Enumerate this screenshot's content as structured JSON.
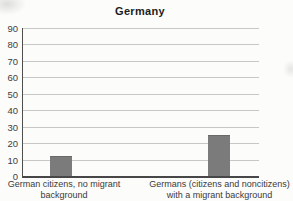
{
  "chart_data": {
    "type": "bar",
    "title": "Germany",
    "categories": [
      "German citizens, no migrant background",
      "Germans (citizens and noncitizens) with a migrant background"
    ],
    "values": [
      12,
      25
    ],
    "xlabel": "",
    "ylabel": "",
    "ylim": [
      0,
      90
    ],
    "yticks": [
      0,
      10,
      20,
      30,
      40,
      50,
      60,
      70,
      80,
      90
    ],
    "grid": true,
    "legend_position": "none",
    "bar_color": "#7b7b7b",
    "gridline_color": "#c7c7c7",
    "axis_color": "#4e4e4e",
    "text_color": "#3a3a3a",
    "background_color": "#fcfcfb"
  },
  "x_labels": [
    {
      "line1": "German citizens, no migrant",
      "line2": "background"
    },
    {
      "line1": "Germans (citizens and noncitizens)",
      "line2": "with a migrant background"
    }
  ]
}
